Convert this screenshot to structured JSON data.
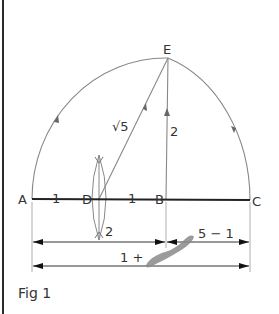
{
  "figure": {
    "caption": "Fig 1",
    "points": {
      "A": {
        "label": "A"
      },
      "B": {
        "label": "B"
      },
      "C": {
        "label": "C"
      },
      "D": {
        "label": "D"
      },
      "E": {
        "label": "E"
      }
    },
    "segment_labels": {
      "AD": "1",
      "DB": "1",
      "DE": "√5",
      "BE": "2",
      "bisector": "2"
    },
    "dimensions": {
      "AB": "2",
      "BC": "√5 − 1",
      "AC": "1 + √5",
      "BC_visible": "5 − 1",
      "AC_visible": "1 +"
    },
    "colors": {
      "line": "#888888",
      "baseline": "#222222",
      "text": "#333333",
      "smudge": "#8a8a8a"
    }
  }
}
